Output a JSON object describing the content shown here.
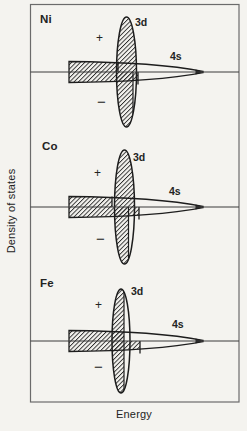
{
  "figure": {
    "x_axis_label": "Energy",
    "y_axis_label": "Density of states",
    "band_labels": {
      "d": "3d",
      "s": "4s"
    },
    "spin_labels": {
      "plus": "+",
      "minus": "−"
    },
    "panels": [
      {
        "metal": "Ni"
      },
      {
        "metal": "Co"
      },
      {
        "metal": "Fe"
      }
    ]
  },
  "colors": {
    "ink": "#222222",
    "border": "#6b6b6b",
    "paper": "#f4f3ef"
  }
}
